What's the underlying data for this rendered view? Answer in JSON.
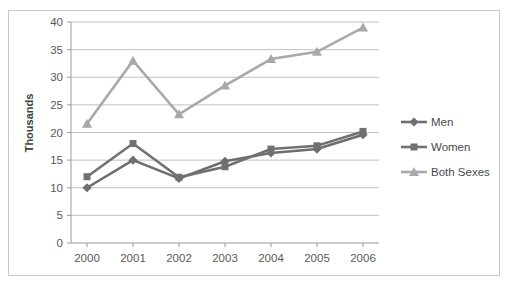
{
  "chart_data": {
    "type": "line",
    "title": "",
    "subtitle": "",
    "xlabel": "",
    "ylabel": "Thousands",
    "categories": [
      "2000",
      "2001",
      "2002",
      "2003",
      "2004",
      "2005",
      "2006"
    ],
    "x": [
      2000,
      2001,
      2002,
      2003,
      2004,
      2005,
      2006
    ],
    "ylim": [
      0,
      40
    ],
    "y_ticks": [
      0,
      5,
      10,
      15,
      20,
      25,
      30,
      35,
      40
    ],
    "grid": true,
    "legend_position": "right",
    "series": [
      {
        "name": "Men",
        "marker": "diamond",
        "color": "#6e6e6e",
        "values": [
          10,
          15,
          11.7,
          14.8,
          16.3,
          17,
          19.6
        ]
      },
      {
        "name": "Women",
        "marker": "square",
        "color": "#717171",
        "values": [
          12,
          18,
          11.9,
          13.8,
          17,
          17.6,
          20.2
        ]
      },
      {
        "name": "Both Sexes",
        "marker": "triangle",
        "color": "#a9a9a9",
        "values": [
          21.6,
          33,
          23.3,
          28.5,
          33.3,
          34.6,
          39
        ]
      }
    ]
  },
  "axis": {
    "y_title": "Thousands",
    "y_tick_labels": [
      "40",
      "35",
      "30",
      "25",
      "20",
      "15",
      "10",
      "5",
      "0"
    ],
    "x_tick_labels": [
      "2000",
      "2001",
      "2002",
      "2003",
      "2004",
      "2005",
      "2006"
    ]
  },
  "legend": {
    "entries": [
      {
        "label": "Men",
        "marker": "diamond-marker",
        "color": "#6e6e6e"
      },
      {
        "label": "Women",
        "marker": "square-marker",
        "color": "#717171"
      },
      {
        "label": "Both Sexes",
        "marker": "triangle-marker",
        "color": "#a9a9a9"
      }
    ]
  },
  "colors": {
    "men": "#6e6e6e",
    "women": "#717171",
    "both_sexes": "#a9a9a9",
    "gridline": "#b0b0b0",
    "border": "#c9c9c9",
    "text": "#595959"
  }
}
